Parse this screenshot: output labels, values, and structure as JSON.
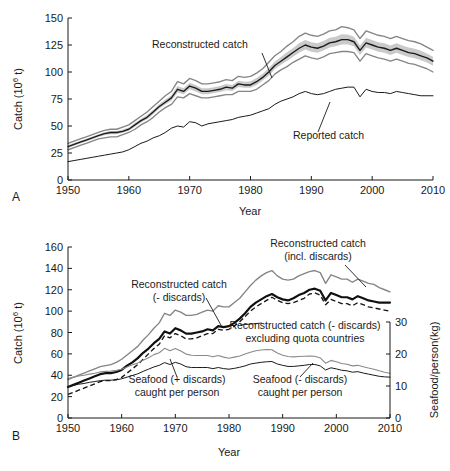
{
  "figure": {
    "panel_a_letter": "A",
    "panel_b_letter": "B"
  },
  "panel_a": {
    "xlabel": "Year",
    "ylabel_prefix": "Catch (10",
    "ylabel_sup": "6",
    "ylabel_suffix": " t)",
    "xticks": [
      "1950",
      "1960",
      "1970",
      "1980",
      "1990",
      "2000",
      "2010"
    ],
    "yticks": [
      "0",
      "25",
      "50",
      "75",
      "100",
      "125",
      "150"
    ],
    "annotations": [
      {
        "name": "reconstructed-catch",
        "text": "Reconstructed catch"
      },
      {
        "name": "reported-catch",
        "text": "Reported catch"
      }
    ]
  },
  "panel_b": {
    "xlabel": "Year",
    "ylabel_prefix": "Catch (10",
    "ylabel_sup": "6",
    "ylabel_suffix": " t)",
    "ylabel_right": "Seafood/person(kg)",
    "xticks": [
      "1950",
      "1960",
      "1970",
      "1980",
      "1990",
      "2000",
      "2010"
    ],
    "yticks": [
      "0",
      "20",
      "40",
      "60",
      "80",
      "100",
      "120",
      "140",
      "160"
    ],
    "yticks_right": [
      "0",
      "10",
      "20",
      "30"
    ],
    "annotations": [
      {
        "name": "reconstructed-incl-discards",
        "line1": "Reconstructed catch",
        "line2": "(incl. discards)"
      },
      {
        "name": "reconstructed-minus-discards",
        "line1": "Reconstructed catch",
        "line2": "(- discards)"
      },
      {
        "name": "reconstructed-excl-quota",
        "line1": "Reconstructed catch (- discards)",
        "line2": "excluding quota countries"
      },
      {
        "name": "seafood-plus-discards",
        "line1": "Seafood (+ discards)",
        "line2": "caught per person"
      },
      {
        "name": "seafood-minus-discards",
        "line1": "Seafood (- discards)",
        "line2": "caught per person"
      }
    ]
  },
  "chart_data": [
    {
      "type": "line",
      "id": "panel-a",
      "title": "Reconstructed vs reported global marine fisheries catch",
      "xlabel": "Year",
      "ylabel": "Catch (10^6 t)",
      "xlim": [
        1950,
        2010
      ],
      "ylim": [
        0,
        150
      ],
      "xticks": [
        1950,
        1960,
        1970,
        1980,
        1990,
        2000,
        2010
      ],
      "yticks": [
        0,
        25,
        50,
        75,
        100,
        125,
        150
      ],
      "grid": false,
      "legend": "annotations-inline",
      "x": [
        1950,
        1951,
        1952,
        1953,
        1954,
        1955,
        1956,
        1957,
        1958,
        1959,
        1960,
        1961,
        1962,
        1963,
        1964,
        1965,
        1966,
        1967,
        1968,
        1969,
        1970,
        1971,
        1972,
        1973,
        1974,
        1975,
        1976,
        1977,
        1978,
        1979,
        1980,
        1981,
        1982,
        1983,
        1984,
        1985,
        1986,
        1987,
        1988,
        1989,
        1990,
        1991,
        1992,
        1993,
        1994,
        1995,
        1996,
        1997,
        1998,
        1999,
        2000,
        2001,
        2002,
        2003,
        2004,
        2005,
        2006,
        2007,
        2008,
        2009,
        2010
      ],
      "series": [
        {
          "name": "Reconstructed catch",
          "style": "solid-dark",
          "values": [
            31,
            33,
            35,
            37,
            39,
            41,
            43,
            44,
            44,
            45,
            47,
            51,
            55,
            58,
            63,
            68,
            72,
            76,
            84,
            82,
            87,
            85,
            82,
            82,
            83,
            84,
            86,
            85,
            89,
            88,
            88,
            91,
            95,
            100,
            106,
            110,
            114,
            118,
            122,
            125,
            123,
            122,
            124,
            127,
            128,
            130,
            130,
            128,
            120,
            127,
            125,
            123,
            122,
            120,
            122,
            120,
            118,
            117,
            115,
            113,
            110
          ]
        },
        {
          "name": "Reconstructed catch upper bound",
          "style": "solid-gray",
          "values": [
            34,
            36,
            38,
            40,
            42,
            44,
            46,
            47,
            47,
            49,
            51,
            55,
            59,
            63,
            68,
            73,
            78,
            82,
            91,
            89,
            94,
            92,
            89,
            89,
            90,
            91,
            93,
            92,
            96,
            95,
            96,
            99,
            103,
            109,
            115,
            119,
            124,
            128,
            133,
            136,
            134,
            133,
            135,
            138,
            139,
            142,
            141,
            139,
            131,
            138,
            136,
            134,
            133,
            131,
            133,
            131,
            129,
            128,
            126,
            123,
            120
          ]
        },
        {
          "name": "Reconstructed catch lower bound",
          "style": "solid-gray",
          "values": [
            28,
            30,
            32,
            34,
            36,
            38,
            39,
            40,
            40,
            42,
            44,
            47,
            51,
            54,
            58,
            63,
            67,
            70,
            77,
            76,
            80,
            78,
            76,
            76,
            77,
            78,
            79,
            79,
            82,
            82,
            82,
            84,
            88,
            92,
            98,
            102,
            105,
            109,
            112,
            115,
            113,
            112,
            114,
            117,
            118,
            119,
            119,
            118,
            110,
            117,
            115,
            113,
            112,
            110,
            112,
            110,
            108,
            107,
            105,
            103,
            100
          ]
        },
        {
          "name": "Reported catch",
          "style": "solid-thin",
          "values": [
            17,
            18,
            19,
            20,
            21,
            22,
            23,
            24,
            25,
            26,
            28,
            31,
            34,
            36,
            39,
            41,
            44,
            48,
            50,
            49,
            54,
            53,
            50,
            52,
            53,
            54,
            55,
            56,
            58,
            59,
            60,
            62,
            64,
            66,
            70,
            73,
            75,
            77,
            80,
            82,
            80,
            79,
            80,
            82,
            84,
            85,
            86,
            86,
            77,
            84,
            82,
            81,
            81,
            80,
            82,
            81,
            80,
            79,
            78,
            78,
            78
          ]
        }
      ]
    },
    {
      "type": "line",
      "id": "panel-b",
      "title": "Reconstructed catch with and without discards and seafood per person",
      "xlabel": "Year",
      "ylabel": "Catch (10^6 t)",
      "ylabel_right": "Seafood/person(kg)",
      "xlim": [
        1950,
        2010
      ],
      "ylim": [
        0,
        160
      ],
      "ylim_right": [
        0,
        35
      ],
      "xticks": [
        1950,
        1960,
        1970,
        1980,
        1990,
        2000,
        2010
      ],
      "yticks": [
        0,
        20,
        40,
        60,
        80,
        100,
        120,
        140,
        160
      ],
      "yticks_right": [
        0,
        10,
        20,
        30
      ],
      "grid": false,
      "legend": "annotations-inline",
      "x": [
        1950,
        1951,
        1952,
        1953,
        1954,
        1955,
        1956,
        1957,
        1958,
        1959,
        1960,
        1961,
        1962,
        1963,
        1964,
        1965,
        1966,
        1967,
        1968,
        1969,
        1970,
        1971,
        1972,
        1973,
        1974,
        1975,
        1976,
        1977,
        1978,
        1979,
        1980,
        1981,
        1982,
        1983,
        1984,
        1985,
        1986,
        1987,
        1988,
        1989,
        1990,
        1991,
        1992,
        1993,
        1994,
        1995,
        1996,
        1997,
        1998,
        1999,
        2000,
        2001,
        2002,
        2003,
        2004,
        2005,
        2006,
        2007,
        2008,
        2009,
        2010
      ],
      "series": [
        {
          "name": "Reconstructed catch (incl. discards)",
          "axis": "left",
          "style": "solid-gray",
          "values": [
            36,
            38,
            40,
            42,
            44,
            46,
            48,
            49,
            50,
            52,
            55,
            59,
            63,
            67,
            73,
            78,
            84,
            89,
            98,
            96,
            101,
            99,
            96,
            96,
            97,
            99,
            101,
            100,
            105,
            104,
            104,
            108,
            112,
            118,
            124,
            129,
            133,
            136,
            138,
            133,
            130,
            129,
            130,
            133,
            135,
            137,
            138,
            136,
            126,
            134,
            132,
            130,
            130,
            127,
            130,
            128,
            126,
            125,
            122,
            120,
            118
          ]
        },
        {
          "name": "Reconstructed catch (- discards)",
          "axis": "left",
          "style": "solid-dark-bold",
          "values": [
            29,
            31,
            33,
            35,
            37,
            39,
            41,
            42,
            42,
            43,
            45,
            49,
            52,
            56,
            61,
            65,
            70,
            74,
            81,
            79,
            84,
            82,
            79,
            79,
            80,
            81,
            83,
            82,
            86,
            85,
            86,
            89,
            93,
            98,
            104,
            108,
            111,
            114,
            116,
            113,
            111,
            110,
            112,
            115,
            117,
            120,
            121,
            119,
            110,
            117,
            115,
            113,
            113,
            111,
            114,
            112,
            110,
            109,
            108,
            108,
            108
          ]
        },
        {
          "name": "Reconstructed catch (- discards) excluding quota countries",
          "axis": "left",
          "style": "dashed-dark",
          "values": [
            22,
            24,
            26,
            28,
            30,
            32,
            34,
            35,
            35,
            36,
            38,
            42,
            46,
            50,
            55,
            60,
            65,
            69,
            77,
            75,
            79,
            77,
            74,
            74,
            75,
            77,
            79,
            79,
            83,
            82,
            83,
            86,
            90,
            95,
            100,
            104,
            107,
            110,
            113,
            110,
            108,
            107,
            108,
            110,
            112,
            116,
            117,
            115,
            106,
            111,
            109,
            107,
            107,
            105,
            108,
            106,
            104,
            103,
            102,
            101,
            100
          ]
        },
        {
          "name": "Seafood (+ discards) caught per person",
          "axis": "right",
          "units": "kg",
          "style": "solid-gray-thin",
          "values": [
            14.4,
            14.9,
            15.3,
            15.6,
            16.0,
            16.3,
            16.8,
            17.0,
            17.1,
            17.4,
            17.8,
            18.6,
            19.4,
            20.0,
            21.1,
            22.0,
            23.1,
            23.8,
            25.4,
            24.5,
            25.3,
            24.4,
            23.3,
            22.9,
            22.8,
            22.8,
            22.8,
            22.3,
            22.8,
            22.2,
            21.8,
            22.2,
            22.6,
            23.3,
            24.0,
            24.5,
            24.8,
            25.0,
            24.9,
            23.7,
            22.9,
            22.4,
            22.3,
            22.4,
            22.5,
            22.6,
            22.5,
            21.9,
            20.0,
            21.0,
            20.5,
            19.9,
            19.6,
            19.0,
            19.2,
            18.7,
            18.2,
            17.8,
            17.2,
            16.7,
            16.3
          ]
        },
        {
          "name": "Seafood (- discards) caught per person",
          "axis": "right",
          "units": "kg",
          "style": "solid-thin",
          "values": [
            11.5,
            11.9,
            12.3,
            12.6,
            13.0,
            13.3,
            13.6,
            13.8,
            13.8,
            13.9,
            14.3,
            14.9,
            15.5,
            16.1,
            17.0,
            17.8,
            18.6,
            19.2,
            20.2,
            19.5,
            20.3,
            19.7,
            18.7,
            18.4,
            18.4,
            18.4,
            18.4,
            18.0,
            18.4,
            18.0,
            17.8,
            18.1,
            18.5,
            19.0,
            19.7,
            20.0,
            20.3,
            20.5,
            20.6,
            19.7,
            19.2,
            18.8,
            18.8,
            19.0,
            19.2,
            19.5,
            19.5,
            19.0,
            17.5,
            18.3,
            17.9,
            17.4,
            17.2,
            16.7,
            16.9,
            16.4,
            16.0,
            15.6,
            15.2,
            15.0,
            14.9
          ]
        }
      ]
    }
  ]
}
